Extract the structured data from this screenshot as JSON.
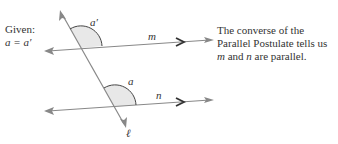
{
  "given": {
    "label": "Given:",
    "equation": "a = a′"
  },
  "labels": {
    "angle_top": "a′",
    "angle_bottom": "a",
    "line_m": "m",
    "line_n": "n",
    "transversal": "ℓ"
  },
  "caption": {
    "line1": "The converse of the",
    "line2": "Parallel Postulate tells us",
    "line3_m": "m",
    "line3_mid": " and ",
    "line3_n": "n",
    "line3_end": " are parallel."
  },
  "colors": {
    "line": "#888888",
    "arc": "#444444",
    "fill": "#e8e8e8",
    "arrow": "#333333"
  }
}
